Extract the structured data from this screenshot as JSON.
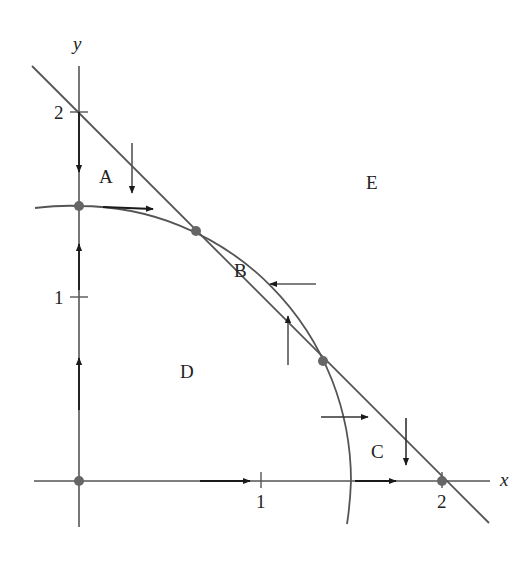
{
  "diagram": {
    "type": "phase-plane",
    "colors": {
      "curve": "#555555",
      "arrow": "#1a1a1a",
      "dot": "#666666",
      "text": "#222222",
      "background": "#ffffff"
    },
    "axes": {
      "x_label": "x",
      "y_label": "y",
      "x_ticks": [
        {
          "value": 1,
          "label": "1"
        },
        {
          "value": 2,
          "label": "2"
        }
      ],
      "y_ticks": [
        {
          "value": 1,
          "label": "1"
        },
        {
          "value": 2,
          "label": "2"
        }
      ]
    },
    "curves": [
      {
        "name": "line",
        "equation": "x + y = 2"
      },
      {
        "name": "circle-arc",
        "equation": "x^2 + y^2 = 2.25"
      }
    ],
    "equilibria": [
      {
        "x": 0,
        "y": 0
      },
      {
        "x": 0,
        "y": 1.5
      },
      {
        "x": 0.65,
        "y": 1.35
      },
      {
        "x": 1.35,
        "y": 0.65
      },
      {
        "x": 2,
        "y": 0
      }
    ],
    "regions": {
      "A": "A",
      "B": "B",
      "C": "C",
      "D": "D",
      "E": "E"
    }
  }
}
